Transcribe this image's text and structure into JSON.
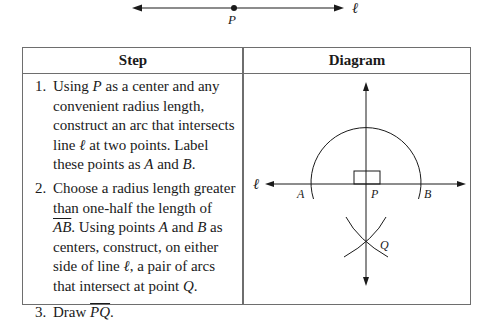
{
  "top_figure": {
    "point_label": "P",
    "line_label": "ℓ"
  },
  "table": {
    "headers": {
      "step": "Step",
      "diagram": "Diagram"
    },
    "steps": [
      {
        "number": "1.",
        "lines": [
          [
            "Using ",
            {
              "i": "P"
            },
            " as a center and any"
          ],
          [
            "convenient radius length,"
          ],
          [
            "construct an arc that intersects"
          ],
          [
            "line ",
            {
              "i": "ℓ"
            },
            " at two points. Label"
          ],
          [
            "these points as ",
            {
              "i": "A"
            },
            " and ",
            {
              "i": "B"
            },
            "."
          ]
        ],
        "text": "Using P as a center and any convenient radius length, construct an arc that intersects line ℓ at two points. Label these points as A and B."
      },
      {
        "number": "2.",
        "lines": [
          [
            "Choose a radius length greater"
          ],
          [
            "than one-half the length of"
          ],
          [
            {
              "o": "AB"
            },
            ". Using points ",
            {
              "i": "A"
            },
            " and ",
            {
              "i": "B"
            },
            " as"
          ],
          [
            "centers, construct, on either"
          ],
          [
            "side of line ",
            {
              "i": "ℓ"
            },
            ", a pair of arcs"
          ],
          [
            "that intersect at point ",
            {
              "i": "Q"
            },
            "."
          ]
        ],
        "text": "Choose a radius length greater than one-half the length of AB. Using points A and B as centers, construct, on either side of line ℓ, a pair of arcs that intersect at point Q."
      },
      {
        "number": "3.",
        "lines": [
          [
            "Draw ",
            {
              "o": "PQ"
            },
            "."
          ]
        ],
        "text": "Draw PQ (line)."
      }
    ]
  },
  "diagram": {
    "labels": {
      "line": "ℓ",
      "A": "A",
      "P": "P",
      "B": "B",
      "Q": "Q"
    }
  }
}
